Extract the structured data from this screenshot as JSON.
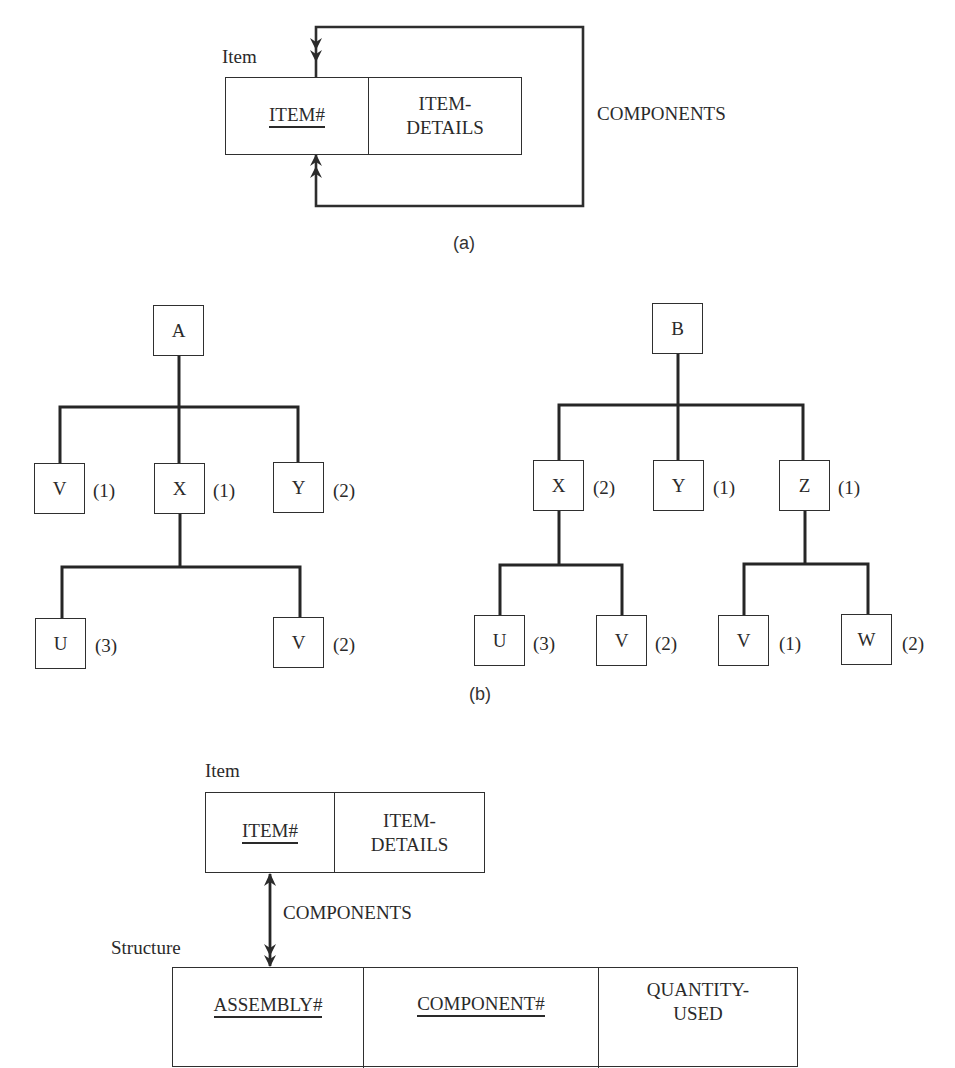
{
  "panel_a": {
    "caption": "(a)",
    "entity_label": "Item",
    "fields": [
      {
        "name": "ITEM#",
        "is_key": true
      },
      {
        "name_line1": "ITEM-",
        "name_line2": "DETAILS",
        "is_key": false
      }
    ],
    "relationship_label": "COMPONENTS",
    "relationship_type": "recursive many-to-many"
  },
  "panel_b": {
    "caption": "(b)",
    "trees": [
      {
        "root": "A",
        "children": [
          {
            "label": "V",
            "qty": "(1)"
          },
          {
            "label": "X",
            "qty": "(1)",
            "children": [
              {
                "label": "U",
                "qty": "(3)"
              },
              {
                "label": "V",
                "qty": "(2)"
              }
            ]
          },
          {
            "label": "Y",
            "qty": "(2)"
          }
        ]
      },
      {
        "root": "B",
        "children": [
          {
            "label": "X",
            "qty": "(2)",
            "children": [
              {
                "label": "U",
                "qty": "(3)"
              },
              {
                "label": "V",
                "qty": "(2)"
              }
            ]
          },
          {
            "label": "Y",
            "qty": "(1)"
          },
          {
            "label": "Z",
            "qty": "(1)",
            "children": [
              {
                "label": "V",
                "qty": "(1)"
              },
              {
                "label": "W",
                "qty": "(2)"
              }
            ]
          }
        ]
      }
    ]
  },
  "panel_c": {
    "item_entity": {
      "label": "Item",
      "fields": [
        {
          "name": "ITEM#",
          "is_key": true
        },
        {
          "name_line1": "ITEM-",
          "name_line2": "DETAILS",
          "is_key": false
        }
      ]
    },
    "relationship_label": "COMPONENTS",
    "structure_entity": {
      "label": "Structure",
      "fields": [
        {
          "name": "ASSEMBLY#",
          "is_key": true
        },
        {
          "name": "COMPONENT#",
          "is_key": true
        },
        {
          "name_line1": "QUANTITY-",
          "name_line2": "USED",
          "is_key": false
        }
      ]
    }
  },
  "colors": {
    "ink": "#2a2a2a",
    "background": "#ffffff"
  }
}
